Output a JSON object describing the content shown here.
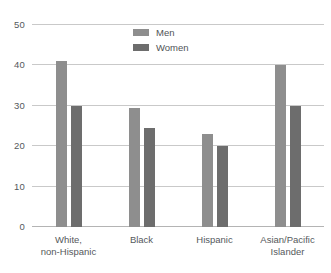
{
  "chart_data": {
    "type": "bar",
    "title": "",
    "subtitle": "",
    "xlabel": "",
    "ylabel": "",
    "ylim": [
      0,
      50
    ],
    "yticks": [
      0,
      10,
      20,
      30,
      40,
      50
    ],
    "ytick_labels": [
      "0",
      "10",
      "20",
      "30",
      "40",
      "50"
    ],
    "grid": true,
    "legend_position": "top-center",
    "categories": [
      "White, non-Hispanic",
      "Black",
      "Hispanic",
      "Asian/Pacific Islander"
    ],
    "category_lines": [
      [
        "White,",
        "non-Hispanic"
      ],
      [
        "Black",
        ""
      ],
      [
        "Hispanic",
        ""
      ],
      [
        "Asian/Pacific",
        "Islander"
      ]
    ],
    "series": [
      {
        "name": "Men",
        "color": "#8e8e8e",
        "values": [
          41,
          29.5,
          23,
          40
        ]
      },
      {
        "name": "Women",
        "color": "#6d6d6d",
        "values": [
          30,
          24.5,
          20,
          30
        ]
      }
    ]
  },
  "legend": {
    "items": [
      {
        "label": "Men",
        "color": "#8e8e8e"
      },
      {
        "label": "Women",
        "color": "#6d6d6d"
      }
    ]
  },
  "axis": {
    "y_labels": [
      "50",
      "40",
      "30",
      "20",
      "10",
      "0"
    ]
  },
  "colors": {
    "men": "#8e8e8e",
    "women": "#6d6d6d",
    "gridline": "#c9c9c9",
    "baseline": "#b4b4b4",
    "text": "#55595c",
    "background": "#ffffff"
  }
}
